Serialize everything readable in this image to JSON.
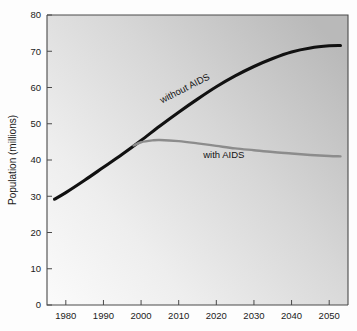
{
  "chart_data": {
    "type": "line",
    "title": "",
    "subtitle": "",
    "xlabel": "",
    "ylabel": "Population (millions)",
    "xlim": [
      1975,
      2055
    ],
    "ylim": [
      0,
      80
    ],
    "grid": false,
    "legend_position": "inline-annotations",
    "x_ticks": [
      1980,
      1990,
      2000,
      2010,
      2020,
      2030,
      2040,
      2050
    ],
    "x_tick_labels": [
      "1980",
      "1990",
      "2000",
      "2010",
      "2020",
      "2030",
      "2040",
      "2050"
    ],
    "y_ticks": [
      0,
      10,
      20,
      30,
      40,
      50,
      60,
      70,
      80
    ],
    "y_tick_labels": [
      "0",
      "10",
      "20",
      "30",
      "40",
      "50",
      "60",
      "70",
      "80"
    ],
    "annotations": [
      {
        "text": "without AIDS",
        "x": 2012,
        "y": 59,
        "rotation": -27
      },
      {
        "text": "with AIDS",
        "x": 2022,
        "y": 40.5,
        "rotation": 0
      }
    ],
    "series": [
      {
        "name": "without AIDS",
        "color": "#111111",
        "x": [
          1977,
          1980,
          1985,
          1990,
          1995,
          2000,
          2005,
          2010,
          2015,
          2020,
          2025,
          2030,
          2035,
          2040,
          2045,
          2050,
          2053
        ],
        "values": [
          29.2,
          31.0,
          34.4,
          38.0,
          41.6,
          45.4,
          49.4,
          53.2,
          56.8,
          60.2,
          63.2,
          65.8,
          68.0,
          69.8,
          70.9,
          71.5,
          71.6
        ]
      },
      {
        "name": "with AIDS",
        "color": "#8c8c8c",
        "x": [
          1998,
          2000,
          2003,
          2005,
          2010,
          2015,
          2020,
          2025,
          2030,
          2035,
          2040,
          2045,
          2050,
          2053
        ],
        "values": [
          44.0,
          44.9,
          45.4,
          45.5,
          45.2,
          44.6,
          43.9,
          43.2,
          42.7,
          42.2,
          41.8,
          41.4,
          41.1,
          41.0
        ]
      }
    ]
  },
  "axes": {
    "y_axis_title": "Population (millions)"
  }
}
